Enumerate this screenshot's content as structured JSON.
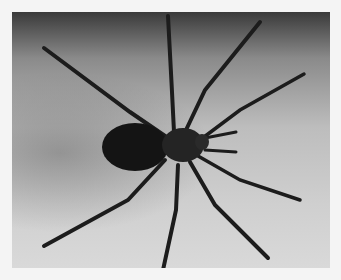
{
  "image": {
    "subject": "spider",
    "style": "grayscale photograph",
    "description": "Top-down view of a long-legged spider with dark oval abdomen, eight segmented legs spread radially against a gradient gray background"
  }
}
